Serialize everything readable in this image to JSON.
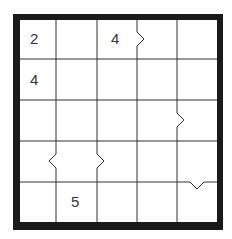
{
  "puzzle": {
    "type": "futoshiki",
    "size": 5,
    "givens": [
      {
        "row": 1,
        "col": 1,
        "value": "2"
      },
      {
        "row": 1,
        "col": 3,
        "value": "4"
      },
      {
        "row": 2,
        "col": 1,
        "value": "4"
      },
      {
        "row": 5,
        "col": 2,
        "value": "5"
      }
    ],
    "inequalities": [
      {
        "row": 1,
        "between_cols": [
          3,
          4
        ],
        "symbol": ">"
      },
      {
        "row": 3,
        "between_cols": [
          4,
          5
        ],
        "symbol": ">"
      },
      {
        "row": 4,
        "between_cols": [
          1,
          2
        ],
        "symbol": "<"
      },
      {
        "row": 4,
        "between_cols": [
          2,
          3
        ],
        "symbol": ">"
      },
      {
        "col": 5,
        "between_rows": [
          4,
          5
        ],
        "symbol": "v"
      }
    ]
  },
  "colors": {
    "border": "#1a1a1a",
    "gridline": "#333333",
    "background": "#ffffff",
    "number": "#333333"
  }
}
